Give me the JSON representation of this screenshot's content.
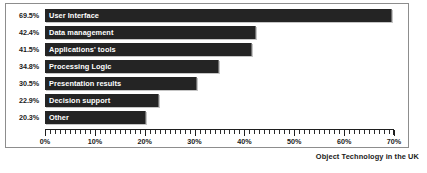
{
  "chart_data": {
    "type": "bar",
    "orientation": "horizontal",
    "title": "",
    "xlabel": "",
    "ylabel": "",
    "xlim": [
      0,
      70
    ],
    "grid": false,
    "legend": null,
    "categories": [
      "User Interface",
      "Data management",
      "Applications' tools",
      "Processing Logic",
      "Presentation results",
      "Decision support",
      "Other"
    ],
    "values": [
      69.5,
      42.4,
      41.5,
      34.8,
      30.5,
      22.9,
      20.3
    ],
    "value_labels": [
      "69.5%",
      "42.4%",
      "41.5%",
      "34.8%",
      "30.5%",
      "22.9%",
      "20.3%"
    ],
    "xticks": [
      0,
      10,
      20,
      30,
      40,
      50,
      60,
      70
    ],
    "xtick_labels": [
      "0%",
      "10%",
      "20%",
      "30%",
      "40%",
      "50%",
      "60%",
      "70%"
    ],
    "minor_tick_interval": 1,
    "bar_color": "#242424",
    "bar_label_color": "#ffffff",
    "axis_color": "#1f1f1f",
    "background": "#ffffff"
  },
  "footer": {
    "credit": "Object Technology in the UK",
    "credit_sub": ""
  }
}
